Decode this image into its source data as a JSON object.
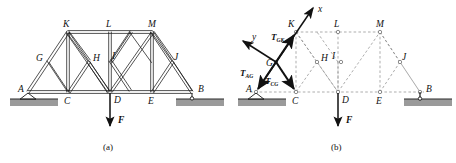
{
  "figure": {
    "panels": [
      {
        "id": "a",
        "caption": "(a)",
        "style": "solid-truss",
        "joint_labels": [
          "A",
          "B",
          "C",
          "D",
          "E",
          "G",
          "H",
          "I",
          "J",
          "K",
          "L",
          "M"
        ],
        "load_label": "F",
        "load_applied_at": "D",
        "support_left": "pin",
        "support_left_at": "A",
        "support_right": "roller",
        "support_right_at": "B"
      },
      {
        "id": "b",
        "caption": "(b)",
        "style": "free-body-dashed",
        "joint_labels": [
          "A",
          "B",
          "C",
          "D",
          "E",
          "G",
          "H",
          "I",
          "J",
          "K",
          "L",
          "M"
        ],
        "load_label": "F",
        "load_applied_at": "D",
        "support_left": "pin",
        "support_left_at": "A",
        "support_right": "roller",
        "support_right_at": "B",
        "axes": [
          {
            "name": "x-axis",
            "label": "x"
          },
          {
            "name": "y-axis",
            "label": "y"
          }
        ],
        "force_vectors": [
          {
            "name": "tension-gk",
            "symbol": "T",
            "subscript": "GK"
          },
          {
            "name": "tension-ag",
            "symbol": "T",
            "subscript": "AG"
          },
          {
            "name": "tension-cg",
            "symbol": "T",
            "subscript": "CG"
          }
        ]
      }
    ],
    "joints_panel_a": [
      {
        "id": "A",
        "x": 28,
        "y": 92,
        "label": "A",
        "lx": 18,
        "ly": 92
      },
      {
        "id": "C",
        "x": 68,
        "y": 92,
        "label": "C",
        "lx": 64,
        "ly": 104
      },
      {
        "id": "D",
        "x": 110,
        "y": 92,
        "label": "D",
        "lx": 114,
        "ly": 103
      },
      {
        "id": "E",
        "x": 152,
        "y": 92,
        "label": "E",
        "lx": 148,
        "ly": 104
      },
      {
        "id": "B",
        "x": 192,
        "y": 92,
        "label": "B",
        "lx": 198,
        "ly": 92
      },
      {
        "id": "G",
        "x": 48,
        "y": 62,
        "label": "G",
        "lx": 38,
        "ly": 61
      },
      {
        "id": "H",
        "x": 89,
        "y": 62,
        "label": "H",
        "lx": 93,
        "ly": 61
      },
      {
        "id": "I",
        "x": 110,
        "y": 62,
        "label": "I",
        "lx": 112,
        "ly": 59
      },
      {
        "id": "J",
        "x": 172,
        "y": 62,
        "label": "J",
        "lx": 174,
        "ly": 60
      },
      {
        "id": "K",
        "x": 68,
        "y": 32,
        "label": "K",
        "lx": 64,
        "ly": 26
      },
      {
        "id": "L",
        "x": 110,
        "y": 32,
        "label": "L",
        "lx": 107,
        "ly": 26
      },
      {
        "id": "M",
        "x": 152,
        "y": 32,
        "label": "M",
        "lx": 149,
        "ly": 26
      }
    ],
    "joints_panel_b": [
      {
        "id": "A",
        "x": 256,
        "y": 92,
        "label": "A",
        "lx": 246,
        "ly": 92
      },
      {
        "id": "C",
        "x": 296,
        "y": 92,
        "label": "C",
        "lx": 292,
        "ly": 104
      },
      {
        "id": "D",
        "x": 338,
        "y": 92,
        "label": "D",
        "lx": 342,
        "ly": 103
      },
      {
        "id": "E",
        "x": 380,
        "y": 92,
        "label": "E",
        "lx": 376,
        "ly": 104
      },
      {
        "id": "B",
        "x": 420,
        "y": 92,
        "label": "B",
        "lx": 426,
        "ly": 92
      },
      {
        "id": "G",
        "x": 276,
        "y": 62,
        "label": "G",
        "lx": 266,
        "ly": 61
      },
      {
        "id": "H",
        "x": 317,
        "y": 62,
        "label": "H",
        "lx": 321,
        "ly": 61
      },
      {
        "id": "I",
        "x": 338,
        "y": 62,
        "label": "I",
        "lx": 340,
        "ly": 59
      },
      {
        "id": "J",
        "x": 400,
        "y": 62,
        "label": "J",
        "lx": 402,
        "ly": 60
      },
      {
        "id": "K",
        "x": 296,
        "y": 32,
        "label": "K",
        "lx": 292,
        "ly": 26
      },
      {
        "id": "L",
        "x": 338,
        "y": 32,
        "label": "L",
        "lx": 335,
        "ly": 26
      },
      {
        "id": "M",
        "x": 380,
        "y": 32,
        "label": "M",
        "lx": 377,
        "ly": 26
      }
    ],
    "colors": {
      "member": "#1a1a1a",
      "ghost": "#8a8a8a",
      "ground_fill": "#9a9a9a",
      "ground_edge": "#2a2a2a",
      "arrow": "#111111",
      "text": "#111111"
    }
  }
}
